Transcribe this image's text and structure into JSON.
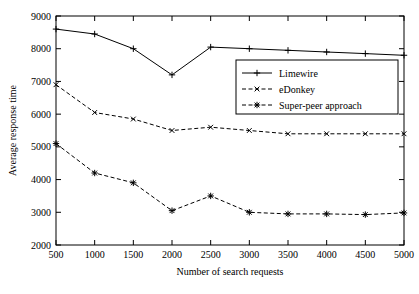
{
  "chart_data": {
    "type": "line",
    "title": "",
    "xlabel": "Number of search requests",
    "ylabel": "Average response time",
    "x": [
      500,
      1000,
      1500,
      2000,
      2500,
      3000,
      3500,
      4000,
      4500,
      5000
    ],
    "xticklabels": [
      "500",
      "1000",
      "1500",
      "2000",
      "2500",
      "3000",
      "3500",
      "4000",
      "4500",
      "5000"
    ],
    "yticklabels": [
      "2000",
      "3000",
      "4000",
      "5000",
      "6000",
      "7000",
      "8000",
      "9000"
    ],
    "xlim": [
      500,
      5000
    ],
    "ylim": [
      2000,
      9000
    ],
    "grid": false,
    "legend_position": "right-upper",
    "series": [
      {
        "name": "Limewire",
        "marker": "plus",
        "linestyle": "solid",
        "values": [
          8600,
          8450,
          8000,
          7200,
          8050,
          8000,
          7950,
          7900,
          7850,
          7800
        ]
      },
      {
        "name": "eDonkey",
        "marker": "cross",
        "linestyle": "dashed",
        "values": [
          6900,
          6050,
          5850,
          5500,
          5600,
          5500,
          5400,
          5400,
          5400,
          5400
        ]
      },
      {
        "name": "Super-peer approach",
        "marker": "star",
        "linestyle": "dashed",
        "values": [
          5100,
          4200,
          3900,
          3050,
          3500,
          3000,
          2950,
          2950,
          2930,
          2980
        ]
      }
    ]
  }
}
